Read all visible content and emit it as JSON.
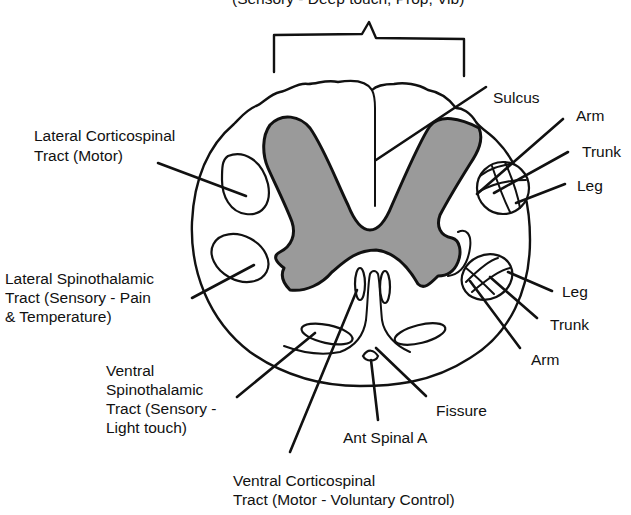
{
  "diagram": {
    "title_partial": "(Sensory - Deep touch, Prop, Vib)",
    "colors": {
      "gray_matter": "#9a9a9a",
      "line": "#111111",
      "background": "#ffffff"
    },
    "labels": {
      "sulcus": "Sulcus",
      "lateral_corticospinal": [
        "Lateral Corticospinal",
        "Tract (Motor)"
      ],
      "lateral_spinothalamic": [
        "Lateral Spinothalamic",
        "Tract (Sensory - Pain",
        "& Temperature)"
      ],
      "ventral_spinothalamic": [
        "Ventral",
        "Spinothalamic",
        "Tract (Sensory -",
        "Light touch)"
      ],
      "ventral_corticospinal": [
        "Ventral Corticospinal",
        "Tract (Motor - Voluntary Control)"
      ],
      "fissure": "Fissure",
      "ant_spinal_a": "Ant Spinal A",
      "upper_right": {
        "arm": "Arm",
        "trunk": "Trunk",
        "leg": "Leg"
      },
      "lower_right": {
        "leg": "Leg",
        "trunk": "Trunk",
        "arm": "Arm"
      }
    }
  }
}
